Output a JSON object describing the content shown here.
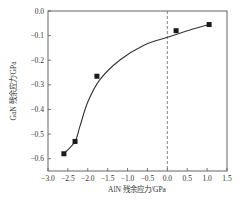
{
  "chart_data": {
    "type": "scatter",
    "title": "",
    "xlabel": "AlN 残余应力/GPa",
    "ylabel": "GaN 残余应力/GPa",
    "xlim": [
      -3.0,
      1.5
    ],
    "ylim": [
      -0.65,
      0.0
    ],
    "xticks": [
      "-3.0",
      "-2.5",
      "-2.0",
      "-1.5",
      "-1.0",
      "-0.5",
      "0.0",
      "0.5",
      "1.0",
      "1.5"
    ],
    "yticks": [
      "0.0",
      "-0.1",
      "-0.2",
      "-0.3",
      "-0.4",
      "-0.5",
      "-0.6"
    ],
    "grid": false,
    "legend": null,
    "series": [
      {
        "name": "data points",
        "marker": "square",
        "x": [
          -2.6,
          -2.32,
          -1.77,
          0.22,
          1.05
        ],
        "y": [
          -0.58,
          -0.53,
          -0.265,
          -0.08,
          -0.055
        ]
      },
      {
        "name": "fit curve",
        "style": "line",
        "x": [
          -2.6,
          -2.32,
          -2.2,
          -2.0,
          -1.7,
          -1.2,
          -0.6,
          0.0,
          0.55,
          1.05
        ],
        "y": [
          -0.58,
          -0.53,
          -0.47,
          -0.37,
          -0.28,
          -0.2,
          -0.14,
          -0.107,
          -0.078,
          -0.055
        ]
      }
    ],
    "annotations": [
      {
        "type": "vertical-dashed-line",
        "x": 0.0
      }
    ]
  },
  "axes": {
    "xlabel": "AlN 残余应力/GPa",
    "ylabel": "GaN 残余应力/GPa"
  }
}
